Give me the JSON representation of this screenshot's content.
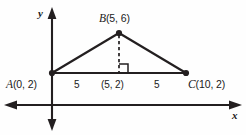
{
  "figure": {
    "background_color": "#fefefe",
    "stroke_color": "#231f20",
    "axes": {
      "x_axis_label": "x",
      "y_axis_label": "y",
      "x_axis_y_px": 105,
      "y_axis_x_px": 52,
      "arrows": [
        "left",
        "right",
        "up",
        "down"
      ]
    },
    "vertices": {
      "A": {
        "label": "A",
        "coords": "(0, 2)",
        "full": "A(0, 2)",
        "x_px": 52,
        "y_px": 73
      },
      "B": {
        "label": "B",
        "coords": "(5, 6)",
        "full": "B(5, 6)",
        "x_px": 119,
        "y_px": 33
      },
      "C": {
        "label": "C",
        "coords": "(10, 2)",
        "full": "C(10, 2)",
        "x_px": 186,
        "y_px": 73
      }
    },
    "foot_of_altitude": {
      "label": "(5, 2)",
      "x_px": 119,
      "y_px": 73,
      "right_angle_marker": true
    },
    "segment_labels": {
      "left": "5",
      "right": "5"
    },
    "altitude": {
      "style": "dashed",
      "from": "B(5, 6)",
      "to": "(5, 2)"
    }
  }
}
